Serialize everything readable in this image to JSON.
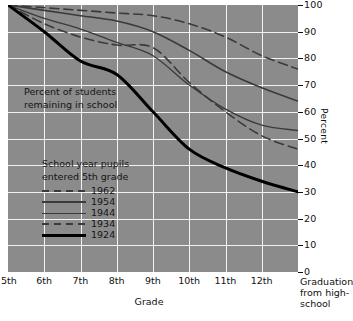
{
  "chart_data": {
    "type": "line",
    "title": "",
    "annotation": [
      "Percent of students",
      "remaining in school"
    ],
    "xlabel": "Grade",
    "ylabel": "Percent",
    "ylim": [
      0,
      100
    ],
    "yticks": [
      100,
      90,
      80,
      70,
      60,
      50,
      40,
      30,
      20,
      10,
      0
    ],
    "grid": true,
    "legend_position": "inside-lower-left",
    "legend_title": [
      "School year pupils",
      "entered 5th grade"
    ],
    "categories": [
      "5th",
      "6th",
      "7th",
      "8th",
      "9th",
      "10th",
      "11th",
      "12th",
      "Graduation"
    ],
    "xticklabels": [
      "5th",
      "6th",
      "7th",
      "8th",
      "9th",
      "10th",
      "11th",
      "12th"
    ],
    "x_end_label": [
      "Graduation",
      "from high-",
      "school"
    ],
    "series": [
      {
        "name": "1962",
        "style": "dashed",
        "color": "#3a3a3a",
        "width": 1.6,
        "values": [
          100,
          99,
          98,
          97,
          96,
          93,
          88,
          81,
          76
        ]
      },
      {
        "name": "1954",
        "style": "solid",
        "color": "#3a3a3a",
        "width": 1.6,
        "values": [
          100,
          98,
          96,
          94,
          90,
          83,
          75,
          69,
          64
        ]
      },
      {
        "name": "1944",
        "style": "solid",
        "color": "#3a3a3a",
        "width": 1.3,
        "values": [
          100,
          95,
          91,
          86,
          81,
          70,
          61,
          55,
          53
        ]
      },
      {
        "name": "1934",
        "style": "dashed",
        "color": "#3a3a3a",
        "width": 1.6,
        "values": [
          100,
          93,
          88,
          85,
          84,
          71,
          60,
          51,
          46
        ]
      },
      {
        "name": "1924",
        "style": "solid",
        "color": "#000000",
        "width": 3.0,
        "values": [
          100,
          90,
          79,
          74,
          60,
          46,
          39,
          34,
          30
        ]
      }
    ]
  }
}
